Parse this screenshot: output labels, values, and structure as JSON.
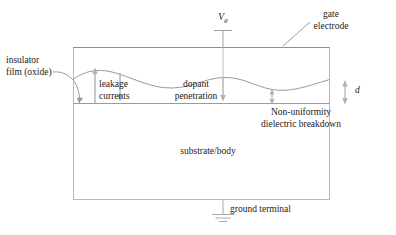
{
  "figure": {
    "type": "cross-section-schematic",
    "background_color": "#ffffff",
    "line_color": "#8c8c8c",
    "text_color": "#1b1b1b"
  },
  "labels": {
    "gate_voltage": "V",
    "gate_voltage_subscript": "g",
    "gate_electrode_line1": "gate",
    "gate_electrode_line2": "electrode",
    "insulator_line1": "insulator",
    "insulator_line2": "film (oxide)",
    "leakage_line1": "leakage",
    "leakage_line2": "currents",
    "dopant_line1": "dopant",
    "dopant_line2": "penetration",
    "nonuniformity_line1": "Non-uniformity",
    "nonuniformity_line2": "dielectric breakdown",
    "substrate": "substrate/body",
    "ground": "ground terminal",
    "thickness": "d"
  },
  "geometry": {
    "box_left": 73,
    "box_right": 330,
    "box_top": 47,
    "box_bottom": 103,
    "substrate_bottom": 200,
    "gate_terminal_x": 223,
    "gate_terminal_y_top": 30,
    "ground_x": 223,
    "ground_y": 213
  }
}
